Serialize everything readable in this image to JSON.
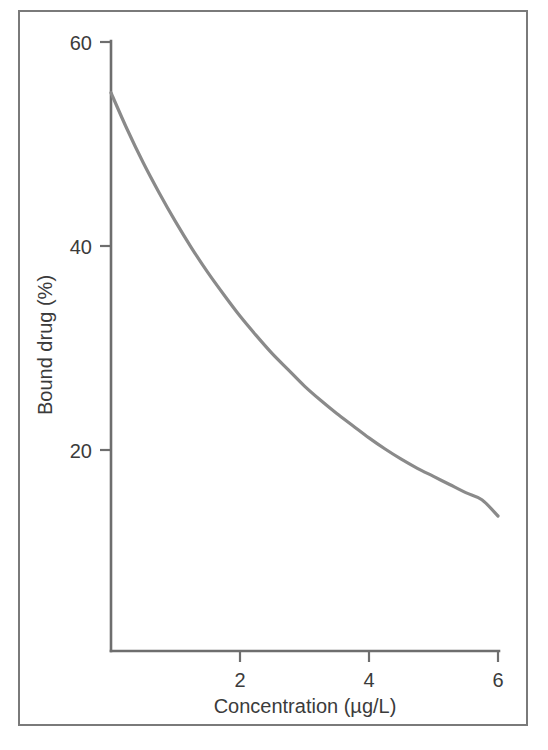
{
  "figure": {
    "border_color": "#7a7a7a",
    "background": "#ffffff"
  },
  "chart_data": {
    "type": "line",
    "title": "",
    "subtitle": "",
    "xlabel": "Concentration (µg/L)",
    "ylabel": "Bound drug (%)",
    "xlim": [
      0,
      6
    ],
    "ylim": [
      0,
      60
    ],
    "xticks": [
      2,
      4,
      6
    ],
    "xtick_labels": [
      "2",
      "4",
      "6"
    ],
    "yticks": [
      20,
      40,
      60
    ],
    "ytick_labels": [
      "20",
      "40",
      "60"
    ],
    "grid": false,
    "legend": false,
    "legend_position": "none",
    "series": [
      {
        "name": "Bound drug",
        "color": "#8a8a8a",
        "x": [
          0.0,
          0.25,
          0.5,
          0.75,
          1.0,
          1.25,
          1.5,
          1.75,
          2.0,
          2.25,
          2.5,
          2.75,
          3.0,
          3.25,
          3.5,
          3.75,
          4.0,
          4.25,
          4.5,
          4.75,
          5.0,
          5.25,
          5.5,
          5.75,
          6.0
        ],
        "y": [
          55.0,
          51.4,
          48.1,
          45.1,
          42.3,
          39.7,
          37.3,
          35.1,
          33.0,
          31.1,
          29.3,
          27.7,
          26.1,
          24.7,
          23.4,
          22.2,
          21.0,
          19.9,
          18.9,
          18.0,
          17.2,
          16.4,
          15.6,
          14.9,
          13.3
        ]
      }
    ],
    "annotations": []
  },
  "axis_titles": {
    "x": "Concentration (µg/L)",
    "y": "Bound drug (%)"
  },
  "tick_text": {
    "y60": "60",
    "y40": "40",
    "y20": "20",
    "x2": "2",
    "x4": "4",
    "x6": "6"
  }
}
